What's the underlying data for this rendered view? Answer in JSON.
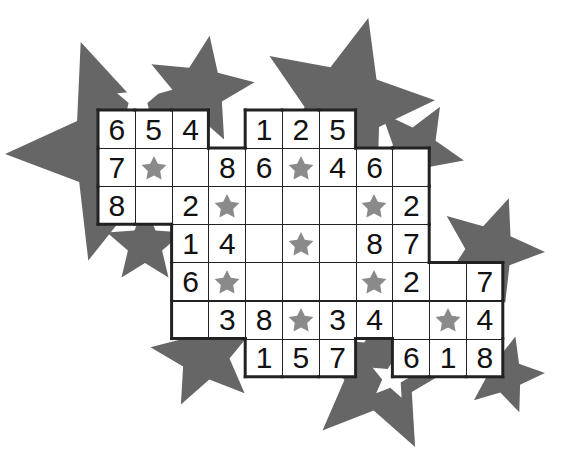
{
  "puzzle": {
    "type": "star-shaped number grid",
    "colors": {
      "background_star": "#666666",
      "cell_star": "#8a8a8a",
      "grid_line": "#222222",
      "cell_bg": "#ffffff"
    },
    "grid_origin": {
      "x": 98,
      "y": 110
    },
    "cell_width": 36.8,
    "cell_height": 38.1,
    "rows": [
      {
        "row": 0,
        "cells": [
          {
            "col": 0,
            "value": "6"
          },
          {
            "col": 1,
            "value": "5"
          },
          {
            "col": 2,
            "value": "4"
          },
          {
            "col": 4,
            "value": "1"
          },
          {
            "col": 5,
            "value": "2"
          },
          {
            "col": 6,
            "value": "5"
          }
        ]
      },
      {
        "row": 1,
        "cells": [
          {
            "col": 0,
            "value": "7"
          },
          {
            "col": 1,
            "value": "star"
          },
          {
            "col": 2,
            "value": ""
          },
          {
            "col": 3,
            "value": "8"
          },
          {
            "col": 4,
            "value": "6"
          },
          {
            "col": 5,
            "value": "star"
          },
          {
            "col": 6,
            "value": "4"
          },
          {
            "col": 7,
            "value": "6"
          },
          {
            "col": 8,
            "value": ""
          }
        ]
      },
      {
        "row": 2,
        "cells": [
          {
            "col": 0,
            "value": "8"
          },
          {
            "col": 1,
            "value": ""
          },
          {
            "col": 2,
            "value": "2"
          },
          {
            "col": 3,
            "value": "star"
          },
          {
            "col": 4,
            "value": ""
          },
          {
            "col": 5,
            "value": ""
          },
          {
            "col": 6,
            "value": ""
          },
          {
            "col": 7,
            "value": "star"
          },
          {
            "col": 8,
            "value": "2"
          }
        ]
      },
      {
        "row": 3,
        "cells": [
          {
            "col": 2,
            "value": "1"
          },
          {
            "col": 3,
            "value": "4"
          },
          {
            "col": 4,
            "value": ""
          },
          {
            "col": 5,
            "value": "star"
          },
          {
            "col": 6,
            "value": ""
          },
          {
            "col": 7,
            "value": "8"
          },
          {
            "col": 8,
            "value": "7"
          }
        ]
      },
      {
        "row": 4,
        "cells": [
          {
            "col": 2,
            "value": "6"
          },
          {
            "col": 3,
            "value": "star"
          },
          {
            "col": 4,
            "value": ""
          },
          {
            "col": 5,
            "value": ""
          },
          {
            "col": 6,
            "value": ""
          },
          {
            "col": 7,
            "value": "star"
          },
          {
            "col": 8,
            "value": "2"
          },
          {
            "col": 9,
            "value": ""
          },
          {
            "col": 10,
            "value": "7"
          }
        ]
      },
      {
        "row": 5,
        "cells": [
          {
            "col": 2,
            "value": ""
          },
          {
            "col": 3,
            "value": "3"
          },
          {
            "col": 4,
            "value": "8"
          },
          {
            "col": 5,
            "value": "star"
          },
          {
            "col": 6,
            "value": "3"
          },
          {
            "col": 7,
            "value": "4"
          },
          {
            "col": 8,
            "value": ""
          },
          {
            "col": 9,
            "value": "star"
          },
          {
            "col": 10,
            "value": "4"
          }
        ]
      },
      {
        "row": 6,
        "cells": [
          {
            "col": 4,
            "value": "1"
          },
          {
            "col": 5,
            "value": "5"
          },
          {
            "col": 6,
            "value": "7"
          },
          {
            "col": 8,
            "value": "6"
          },
          {
            "col": 9,
            "value": "1"
          },
          {
            "col": 10,
            "value": "8"
          }
        ]
      }
    ],
    "background_stars": [
      {
        "cx": 120,
        "cy": 150,
        "r": 115,
        "rot": -20
      },
      {
        "cx": 200,
        "cy": 90,
        "r": 55,
        "rot": 10
      },
      {
        "cx": 345,
        "cy": 105,
        "r": 90,
        "rot": 15
      },
      {
        "cx": 415,
        "cy": 150,
        "r": 50,
        "rot": 30
      },
      {
        "cx": 490,
        "cy": 250,
        "r": 55,
        "rot": 20
      },
      {
        "cx": 145,
        "cy": 245,
        "r": 40,
        "rot": 0
      },
      {
        "cx": 205,
        "cy": 355,
        "r": 55,
        "rot": -10
      },
      {
        "cx": 380,
        "cy": 375,
        "r": 80,
        "rot": 10
      },
      {
        "cx": 505,
        "cy": 375,
        "r": 40,
        "rot": 15
      }
    ],
    "white_stars": [
      {
        "cx": 138,
        "cy": 100,
        "r": 22,
        "rot": 0
      },
      {
        "cx": 392,
        "cy": 378,
        "r": 22,
        "rot": 10
      }
    ]
  }
}
